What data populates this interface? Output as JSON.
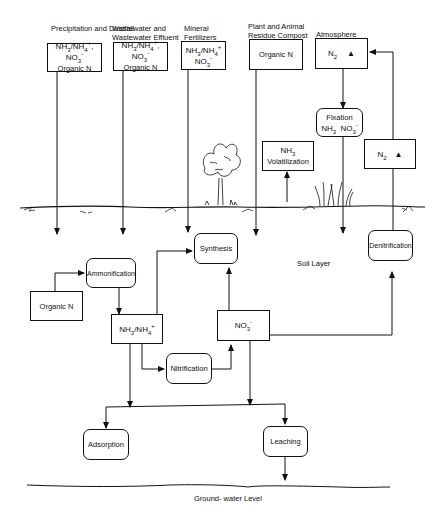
{
  "diagram": {
    "sources": [
      {
        "label": "Precipitation and Dustfall",
        "content_line1": "NH3/NH4+, NO3-",
        "content_line2": "Organic N"
      },
      {
        "label": "Wastewater and Wastewater Effluent",
        "content_line1": "NH3/NH4+, NO3-",
        "content_line2": "Organic N"
      },
      {
        "label": "Mineral Fertilizers",
        "content_line1": "NH3/NH4+",
        "content_line2": "NO3-"
      },
      {
        "label": "Plant and Animal Residue Compost",
        "content_line1": "Organic N"
      },
      {
        "label": "Atmosphere",
        "content_line1": "N2"
      }
    ],
    "processes": {
      "fixation": {
        "title": "Fixation",
        "line2": "NH3  NO3-"
      },
      "volatilization": {
        "line1": "NH3",
        "line2": "Volatilization"
      },
      "n2_release": "N2",
      "synthesis": "Synthesis",
      "ammonification": "Ammonification",
      "organic_n": "Organic N",
      "ammonium": "NH3/NH4+",
      "nitrate": "NO3-",
      "nitrification": "Nitrification",
      "denitrification": "Denitrification",
      "adsorption": "Adsorption",
      "leaching": "Leaching"
    },
    "labels": {
      "soil_layer": "Soil Layer",
      "groundwater": "Ground- water Level"
    },
    "text_parts": {
      "nh3": "NH",
      "sub3": "3",
      "nh4": "/NH",
      "sub4": "4",
      "plus": "+",
      "comma_no": ", NO",
      "no": "NO",
      "minus": "-",
      "n": "N",
      "sub2": "2",
      "up_arrow": "▲"
    }
  }
}
